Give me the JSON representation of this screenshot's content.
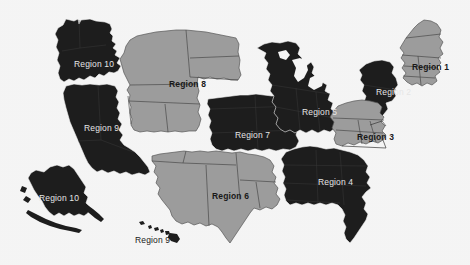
{
  "map": {
    "title": "United States Regions Map",
    "background_color": "#ffffff",
    "colors": {
      "dark_fill": "#1f1f1f",
      "light_fill": "#a3a3a3",
      "light_border": "#4d4d4d",
      "label_on_dark": "#efefef",
      "label_on_light": "#1a1a1a"
    },
    "regions": [
      {
        "id": "region-1",
        "label": "Region 1",
        "shade": "light",
        "label_color": "dark",
        "label_x": 412,
        "label_y": 63,
        "bold": true
      },
      {
        "id": "region-2",
        "label": "Region 2",
        "shade": "dark",
        "label_color": "light",
        "label_x": 376,
        "label_y": 88,
        "bold": false
      },
      {
        "id": "region-3",
        "label": "Region 3",
        "shade": "light",
        "label_color": "dark",
        "label_x": 357,
        "label_y": 133,
        "bold": true
      },
      {
        "id": "region-4",
        "label": "Region 4",
        "shade": "dark",
        "label_color": "light",
        "label_x": 318,
        "label_y": 178,
        "bold": false
      },
      {
        "id": "region-5",
        "label": "Region 5",
        "shade": "dark",
        "label_color": "light",
        "label_x": 302,
        "label_y": 108,
        "bold": false
      },
      {
        "id": "region-6",
        "label": "Region 6",
        "shade": "light",
        "label_color": "dark",
        "label_x": 212,
        "label_y": 192,
        "bold": true
      },
      {
        "id": "region-7",
        "label": "Region 7",
        "shade": "dark",
        "label_color": "light",
        "label_x": 235,
        "label_y": 131,
        "bold": false
      },
      {
        "id": "region-8",
        "label": "Region 8",
        "shade": "light",
        "label_color": "dark",
        "label_x": 169,
        "label_y": 80,
        "bold": true
      },
      {
        "id": "region-9-west",
        "label": "Region 9",
        "shade": "dark",
        "label_color": "light",
        "label_x": 84,
        "label_y": 124,
        "bold": false
      },
      {
        "id": "region-9-hawaii",
        "label": "Region 9",
        "shade": "dark",
        "label_color": "dark",
        "label_x": 135,
        "label_y": 236,
        "bold": false
      },
      {
        "id": "region-10-northwest",
        "label": "Region 10",
        "shade": "dark",
        "label_color": "light",
        "label_x": 74,
        "label_y": 60,
        "bold": false
      },
      {
        "id": "region-10-alaska",
        "label": "Region 10",
        "shade": "dark",
        "label_color": "light",
        "label_x": 39,
        "label_y": 194,
        "bold": false
      }
    ]
  }
}
